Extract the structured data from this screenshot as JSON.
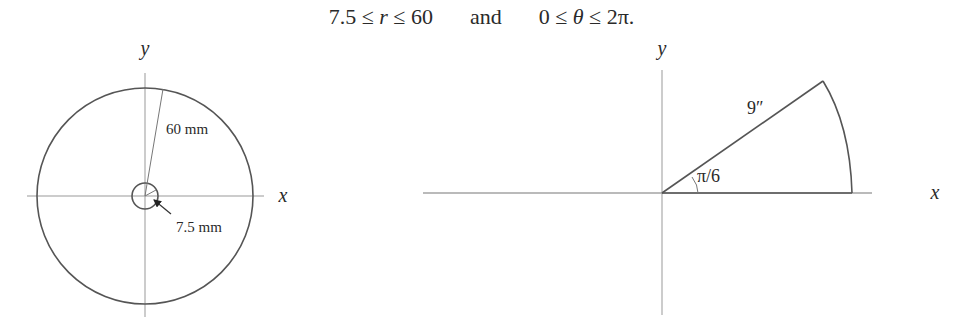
{
  "equation": {
    "r_lower": "7.5",
    "r_var": "r",
    "r_upper": "60",
    "conjunction": "and",
    "theta_lower": "0",
    "theta_var": "θ",
    "theta_upper": "2π.",
    "leq": "≤"
  },
  "left_diagram": {
    "axis_x_label": "x",
    "axis_y_label": "y",
    "outer_radius_label": "60 mm",
    "inner_radius_label": "7.5 mm",
    "outer_radius_mm": 60,
    "inner_radius_mm": 7.5
  },
  "right_diagram": {
    "axis_x_label": "x",
    "axis_y_label": "y",
    "radius_label": "9″",
    "angle_label": "π/6",
    "radius_in": 9,
    "angle": "π/6"
  },
  "colors": {
    "stroke": "#555555",
    "axis": "#888888",
    "text": "#2a2a2a"
  }
}
